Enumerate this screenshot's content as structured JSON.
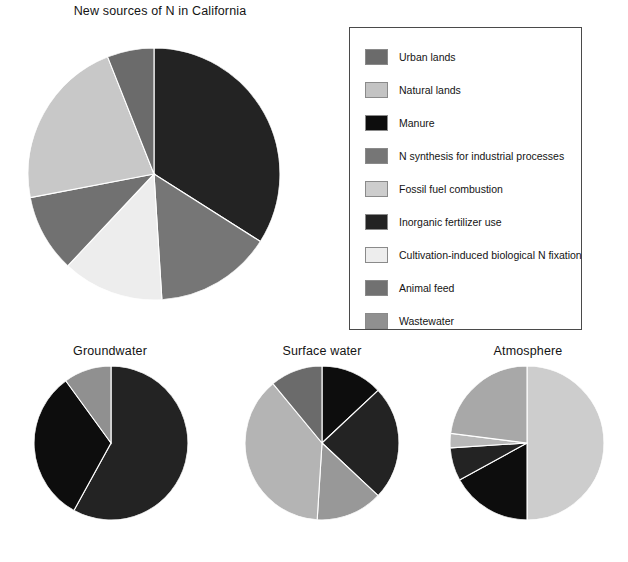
{
  "figure": {
    "background": "#ffffff",
    "width": 628,
    "height": 562
  },
  "legend": {
    "title": "",
    "border_color": "#4a4a4a",
    "items": [
      {
        "label": "Urban lands",
        "color": "#6b6b6b"
      },
      {
        "label": "Natural lands",
        "color": "#c3c3c3"
      },
      {
        "label": "Manure",
        "color": "#0d0d0d"
      },
      {
        "label": "N synthesis for industrial processes",
        "color": "#767676"
      },
      {
        "label": "Fossil fuel combustion",
        "color": "#cdcdcd"
      },
      {
        "label": "Inorganic fertilizer use",
        "color": "#232323"
      },
      {
        "label": "Cultivation-induced biological N fixation",
        "color": "#ededed"
      },
      {
        "label": "Animal feed",
        "color": "#717171"
      },
      {
        "label": "Wastewater",
        "color": "#909090"
      }
    ]
  },
  "footer": {
    "fragment": ""
  },
  "chart_data": [
    {
      "type": "pie",
      "id": "new-sources",
      "title": "New sources of N in California",
      "start_angle": 0,
      "direction": "clockwise",
      "categories": [
        "Inorganic fertilizer use",
        "N synthesis for industrial processes",
        "Cultivation-induced biological N fixation",
        "Animal feed",
        "Fossil fuel combustion",
        "Urban lands"
      ],
      "values": [
        34,
        15,
        13,
        10,
        22,
        6
      ],
      "colors": [
        "#232323",
        "#767676",
        "#ededed",
        "#717171",
        "#c8c8c8",
        "#6b6b6b"
      ],
      "units": "percent"
    },
    {
      "type": "pie",
      "id": "groundwater",
      "title": "Groundwater",
      "start_angle": 0,
      "direction": "clockwise",
      "categories": [
        "Inorganic fertilizer use",
        "Manure",
        "Wastewater"
      ],
      "values": [
        58,
        32,
        10
      ],
      "colors": [
        "#232323",
        "#0d0d0d",
        "#909090"
      ],
      "units": "percent"
    },
    {
      "type": "pie",
      "id": "surface-water",
      "title": "Surface water",
      "start_angle": 0,
      "direction": "clockwise",
      "categories": [
        "Manure",
        "Inorganic fertilizer use",
        "Wastewater",
        "Natural lands",
        "Urban lands"
      ],
      "values": [
        13,
        24,
        14,
        38,
        11
      ],
      "colors": [
        "#0d0d0d",
        "#232323",
        "#989898",
        "#b4b4b4",
        "#6b6b6b"
      ],
      "units": "percent"
    },
    {
      "type": "pie",
      "id": "atmosphere",
      "title": "Atmosphere",
      "start_angle": 0,
      "direction": "clockwise",
      "categories": [
        "Fossil fuel combustion",
        "Manure",
        "Inorganic fertilizer use",
        "Natural lands",
        "Urban lands"
      ],
      "values": [
        50,
        17,
        7,
        3,
        23
      ],
      "colors": [
        "#cdcdcd",
        "#0d0d0d",
        "#232323",
        "#b8b8b8",
        "#a8a8a8"
      ],
      "units": "percent"
    }
  ]
}
